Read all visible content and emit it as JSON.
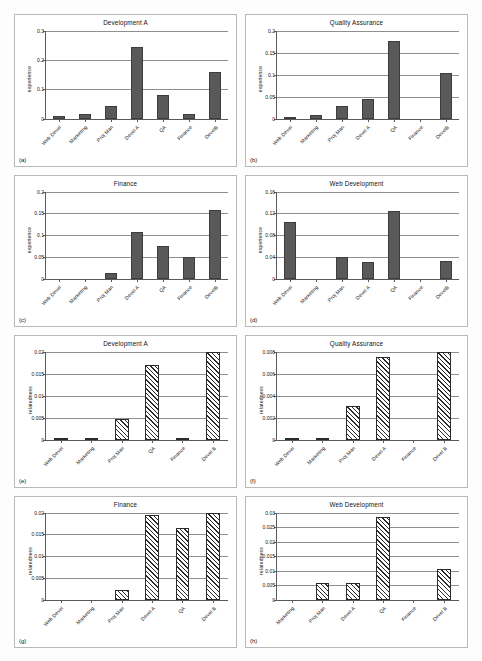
{
  "figure": {
    "ylabel_experience": "experience",
    "ylabel_relatedness": "relatedness"
  },
  "chart_data": [
    {
      "id": "a",
      "letter": "(a)",
      "type": "bar",
      "title": "Development A",
      "ylabel": "experience",
      "xlabel": "",
      "categories": [
        "Web Devel",
        "Marketing",
        "Proj Man",
        "Devel A",
        "QA",
        "Finance",
        "DevelB"
      ],
      "values": [
        0.008,
        0.016,
        0.042,
        0.245,
        0.08,
        0.016,
        0.16
      ],
      "ylim": [
        0,
        0.3
      ],
      "yticks": [
        0,
        0.1,
        0.2,
        0.3
      ],
      "yticklabels": [
        "0",
        "0.1",
        "0.2",
        "0.3"
      ],
      "grid": true,
      "style": "solid"
    },
    {
      "id": "b",
      "letter": "(b)",
      "type": "bar",
      "title": "Quality Assurance",
      "ylabel": "experience",
      "xlabel": "",
      "categories": [
        "Web Devel",
        "Marketing",
        "Proj Man",
        "Devel A",
        "QA",
        "Finance",
        "DevelB"
      ],
      "values": [
        0.004,
        0.007,
        0.028,
        0.044,
        0.178,
        0,
        0.105
      ],
      "ylim": [
        0,
        0.2
      ],
      "yticks": [
        0,
        0.05,
        0.1,
        0.15,
        0.2
      ],
      "yticklabels": [
        "0",
        "0.05",
        "0.1",
        "0.15",
        "0.2"
      ],
      "grid": true,
      "style": "solid"
    },
    {
      "id": "c",
      "letter": "(c)",
      "type": "bar",
      "title": "Finance",
      "ylabel": "experience",
      "xlabel": "",
      "categories": [
        "Web Devel",
        "Marketing",
        "Proj Man",
        "Devel A",
        "QA",
        "Finance",
        "DevelB"
      ],
      "values": [
        0,
        0,
        0.013,
        0.107,
        0.075,
        0.05,
        0.157
      ],
      "ylim": [
        0,
        0.2
      ],
      "yticks": [
        0,
        0.05,
        0.1,
        0.15,
        0.2
      ],
      "yticklabels": [
        "0",
        "0.05",
        "0.1",
        "0.15",
        "0.2"
      ],
      "grid": true,
      "style": "solid"
    },
    {
      "id": "d",
      "letter": "(d)",
      "type": "bar",
      "title": "Web Development",
      "ylabel": "experience",
      "xlabel": "",
      "categories": [
        "Web Devel",
        "Marketing",
        "Proj Man",
        "Devel A",
        "QA",
        "Finance",
        "DevelB"
      ],
      "values": [
        0.105,
        0,
        0.041,
        0.031,
        0.125,
        0,
        0.033
      ],
      "ylim": [
        0,
        0.16
      ],
      "yticks": [
        0,
        0.04,
        0.08,
        0.12,
        0.16
      ],
      "yticklabels": [
        "0",
        "0.04",
        "0.08",
        "0.12",
        "0.16"
      ],
      "grid": true,
      "style": "solid"
    },
    {
      "id": "e",
      "letter": "(e)",
      "type": "bar",
      "title": "Development A",
      "ylabel": "relatedness",
      "xlabel": "",
      "categories": [
        "Web Devel",
        "Marketing",
        "Proj Man",
        "QA",
        "Finance",
        "Devel B"
      ],
      "values": [
        0.0002,
        0.0003,
        0.0048,
        0.017,
        0.0002,
        0.02
      ],
      "ylim": [
        0,
        0.02
      ],
      "yticks": [
        0,
        0.005,
        0.01,
        0.015,
        0.02
      ],
      "yticklabels": [
        "0",
        "0.005",
        "0.01",
        "0.015",
        "0.02"
      ],
      "grid": true,
      "style": "hatched"
    },
    {
      "id": "f",
      "letter": "(f)",
      "type": "bar",
      "title": "Quality Assurance",
      "ylabel": "relatedness",
      "xlabel": "",
      "categories": [
        "Web Devel",
        "Marketing",
        "Proj Man",
        "Devel A",
        "Finance",
        "Devel B"
      ],
      "values": [
        0.0001,
        0.0001,
        0.0031,
        0.0075,
        0,
        0.008
      ],
      "ylim": [
        0,
        0.008
      ],
      "yticks": [
        0,
        0.002,
        0.004,
        0.006,
        0.008
      ],
      "yticklabels": [
        "0",
        "0.002",
        "0.004",
        "0.006",
        "0.008"
      ],
      "grid": true,
      "style": "hatched"
    },
    {
      "id": "g",
      "letter": "(g)",
      "type": "bar",
      "title": "Finance",
      "ylabel": "relatedness",
      "xlabel": "",
      "categories": [
        "Web Devel",
        "Marketing",
        "Proj Man",
        "Devel A",
        "QA",
        "Devel B"
      ],
      "values": [
        0,
        0,
        0.0022,
        0.0195,
        0.0165,
        0.02
      ],
      "ylim": [
        0,
        0.02
      ],
      "yticks": [
        0,
        0.005,
        0.01,
        0.015,
        0.02
      ],
      "yticklabels": [
        "0",
        "0.005",
        "0.01",
        "0.015",
        "0.02"
      ],
      "grid": true,
      "style": "hatched"
    },
    {
      "id": "h",
      "letter": "(h)",
      "type": "bar",
      "title": "Web Development",
      "ylabel": "relatedness",
      "xlabel": "",
      "categories": [
        "Marketing",
        "Proj Man",
        "Devel A",
        "QA",
        "Finance",
        "Devel B"
      ],
      "values": [
        0,
        0.006,
        0.006,
        0.0283,
        0,
        0.0105
      ],
      "ylim": [
        0,
        0.03
      ],
      "yticks": [
        0,
        0.005,
        0.01,
        0.015,
        0.02,
        0.025,
        0.03
      ],
      "yticklabels": [
        "0",
        "0.005",
        "0.01",
        "0.015",
        "0.02",
        "0.025",
        "0.03"
      ],
      "grid": true,
      "style": "hatched"
    }
  ]
}
